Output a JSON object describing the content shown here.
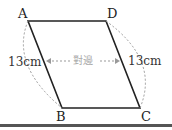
{
  "diagram": {
    "type": "parallelogram",
    "vertices": {
      "A": "A",
      "B": "B",
      "C": "C",
      "D": "D"
    },
    "left_side_length": "13cm",
    "right_side_length": "13cm",
    "middle_label": "對邊",
    "colors": {
      "edge": "#222222",
      "dashed": "#999999",
      "label_muted": "#aaaaaa"
    }
  }
}
